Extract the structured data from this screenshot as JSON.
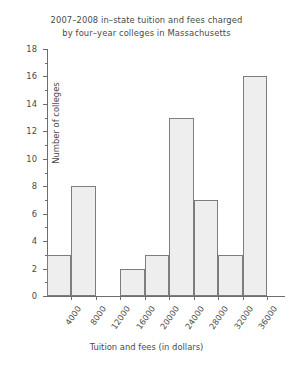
{
  "chart_data": {
    "type": "bar",
    "title_lines": [
      "2007–2008 in–state tuition and fees charged",
      "by four–year colleges in Massachusetts"
    ],
    "xlabel": "Tuition and fees (in dollars)",
    "ylabel": "Number of colleges",
    "categories": [
      "0–4000",
      "4000–8000",
      "8000–12000",
      "12000–16000",
      "16000–20000",
      "20000–24000",
      "24000–28000",
      "28000–32000",
      "32000–36000"
    ],
    "bin_starts": [
      0,
      4000,
      8000,
      12000,
      16000,
      20000,
      24000,
      28000,
      32000
    ],
    "bin_width": 4000,
    "values": [
      3,
      8,
      0,
      2,
      3,
      13,
      7,
      3,
      16
    ],
    "xlim": [
      0,
      38000
    ],
    "ylim": [
      0,
      18
    ],
    "ytick_labels": [
      "0",
      "2",
      "4",
      "6",
      "8",
      "10",
      "12",
      "14",
      "16",
      "18"
    ],
    "ytick_values": [
      0,
      2,
      4,
      6,
      8,
      10,
      12,
      14,
      16,
      18
    ],
    "yminor_values": [
      1,
      3,
      5,
      7,
      9,
      11,
      13,
      15,
      17
    ],
    "xtick_labels": [
      "4000",
      "8000",
      "12000",
      "16000",
      "20000",
      "24000",
      "28000",
      "32000",
      "36000"
    ],
    "xtick_values": [
      4000,
      8000,
      12000,
      16000,
      20000,
      24000,
      28000,
      32000,
      36000
    ],
    "grid": false,
    "legend": null,
    "bar_fill_color": "#eeeeee",
    "bar_border_color": "#7d7d7d",
    "axis_color": "#6d6d6d",
    "text_color": "#4a4a4a",
    "background_color": "#ffffff"
  }
}
